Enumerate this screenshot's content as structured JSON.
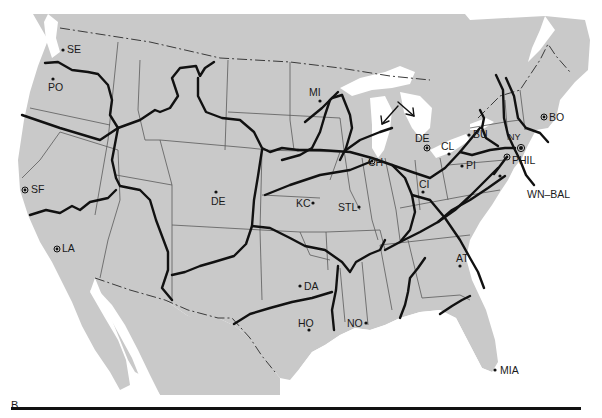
{
  "figure": {
    "panel_label": "B"
  },
  "colors": {
    "land": "#c9c9c9",
    "water": "#ffffff",
    "routes": "#111111",
    "state_lines": "#5a5a5a"
  },
  "cities": [
    {
      "code": "SE",
      "x": 63,
      "y": 50,
      "marker": "dot"
    },
    {
      "code": "PO",
      "x": 53,
      "y": 79,
      "marker": "dot"
    },
    {
      "code": "SF",
      "x": 25,
      "y": 190,
      "marker": "ring"
    },
    {
      "code": "LA",
      "x": 57,
      "y": 249,
      "marker": "ring"
    },
    {
      "code": "DE",
      "x": 216,
      "y": 192,
      "marker": "dot",
      "note": "Denver"
    },
    {
      "code": "MI",
      "x": 320,
      "y": 101,
      "marker": "dot",
      "note": "Minneapolis"
    },
    {
      "code": "KC",
      "x": 313,
      "y": 203,
      "marker": "dot"
    },
    {
      "code": "STL",
      "x": 359,
      "y": 207,
      "marker": "dot"
    },
    {
      "code": "CH",
      "x": 372,
      "y": 161,
      "marker": "ring"
    },
    {
      "code": "DE",
      "x": 427,
      "y": 148,
      "marker": "ring",
      "note": "Detroit"
    },
    {
      "code": "CL",
      "x": 449,
      "y": 154,
      "marker": "dot"
    },
    {
      "code": "BU",
      "x": 469,
      "y": 135,
      "marker": "dot"
    },
    {
      "code": "NY",
      "x": 521,
      "y": 148,
      "marker": "ring"
    },
    {
      "code": "BO",
      "x": 544,
      "y": 117,
      "marker": "ring"
    },
    {
      "code": "PI",
      "x": 462,
      "y": 166,
      "marker": "dot"
    },
    {
      "code": "PHIL",
      "x": 507,
      "y": 157,
      "marker": "ring"
    },
    {
      "code": "WN-BAL",
      "x": 500,
      "y": 176,
      "marker": "dot"
    },
    {
      "code": "CI",
      "x": 423,
      "y": 192,
      "marker": "dot"
    },
    {
      "code": "AT",
      "x": 460,
      "y": 266,
      "marker": "dot"
    },
    {
      "code": "DA",
      "x": 300,
      "y": 286,
      "marker": "dot"
    },
    {
      "code": "HO",
      "x": 309,
      "y": 330,
      "marker": "dot"
    },
    {
      "code": "NO",
      "x": 366,
      "y": 323,
      "marker": "dot"
    },
    {
      "code": "MIA",
      "x": 495,
      "y": 370,
      "marker": "dot"
    }
  ],
  "labels": {
    "SE": "SE",
    "PO": "PO",
    "SF": "SF",
    "LA": "LA",
    "DE_W": "DE",
    "MI": "MI",
    "KC": "KC",
    "STL": "STL",
    "CH": "CH",
    "DE_E": "DE",
    "CL": "CL",
    "BU": "BU",
    "NY": "NY",
    "BO": "BO",
    "PI": "PI",
    "PHIL": "PHIL",
    "WN_BAL": "WN–BAL",
    "CI": "CI",
    "AT": "AT",
    "DA": "DA",
    "HO": "HO",
    "NO": "NO",
    "MIA": "MIA"
  }
}
